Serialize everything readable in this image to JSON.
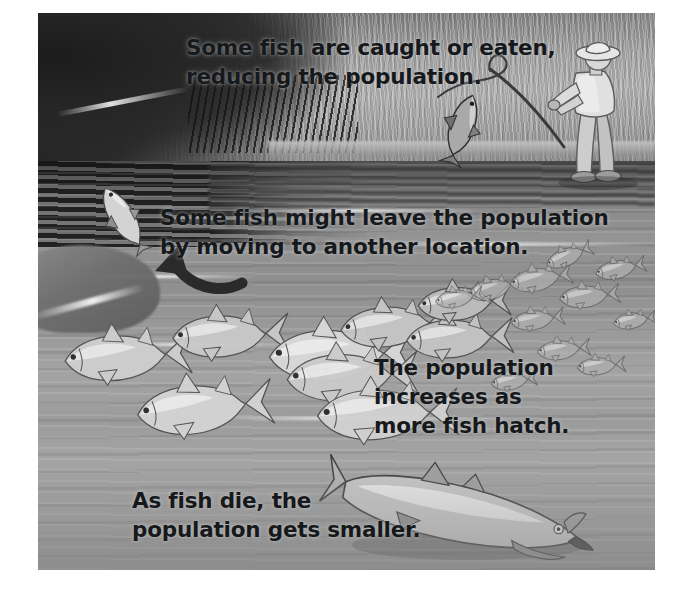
{
  "scene": {
    "title": "Fish population changes illustration",
    "description": "A riverbank scene showing four ways a fish population changes: fish caught by an angler, fish leaving, fish hatching, and fish dying.",
    "border_color": "#ffffff",
    "water_color": "#949494",
    "bank_color": "#a6a6a6",
    "text_color": "#16191c"
  },
  "captions": [
    {
      "id": "caught",
      "name": "caption-caught-or-eaten",
      "text": "Some fish are caught or eaten,\nreducing the population."
    },
    {
      "id": "leave",
      "name": "caption-fish-leave",
      "text": "Some fish might leave the population\nby moving to another location."
    },
    {
      "id": "increase",
      "name": "caption-population-increases",
      "text": "The population\nincreases as\nmore fish hatch."
    },
    {
      "id": "die",
      "name": "caption-fish-die",
      "text": "As fish die, the\npopulation gets smaller."
    }
  ],
  "figures": {
    "angler": "fisherman-figure",
    "caught_fish": "hooked-fish",
    "fishing_rod": "fishing-rod",
    "departure_arrow": "departure-arrow",
    "leaving_fish": "leaving-fish",
    "dead_fish": "dead-fish",
    "school_count": 9,
    "hatchling_count": 11
  },
  "schooling_fish": [
    {
      "x": 24,
      "y": 300,
      "len": 104,
      "tilt": -4,
      "shade": "#cfcfcf"
    },
    {
      "x": 132,
      "y": 282,
      "len": 96,
      "tilt": -3,
      "shade": "#c9c9c9"
    },
    {
      "x": 96,
      "y": 348,
      "len": 112,
      "tilt": -6,
      "shade": "#d4d4d4"
    },
    {
      "x": 228,
      "y": 292,
      "len": 118,
      "tilt": -2,
      "shade": "#d9d9d9"
    },
    {
      "x": 246,
      "y": 318,
      "len": 108,
      "tilt": -3,
      "shade": "#cbcbcb"
    },
    {
      "x": 300,
      "y": 274,
      "len": 92,
      "tilt": -5,
      "shade": "#c6c6c6"
    },
    {
      "x": 276,
      "y": 352,
      "len": 116,
      "tilt": -2,
      "shade": "#d2d2d2"
    },
    {
      "x": 366,
      "y": 288,
      "len": 88,
      "tilt": -3,
      "shade": "#c4c4c4"
    },
    {
      "x": 378,
      "y": 258,
      "len": 76,
      "tilt": -4,
      "shade": "#bdbdbd"
    }
  ],
  "hatchling_fish": [
    {
      "x": 428,
      "y": 256,
      "len": 46,
      "tilt": -14
    },
    {
      "x": 470,
      "y": 244,
      "len": 52,
      "tilt": -10
    },
    {
      "x": 506,
      "y": 226,
      "len": 40,
      "tilt": -22
    },
    {
      "x": 520,
      "y": 262,
      "len": 50,
      "tilt": -6
    },
    {
      "x": 556,
      "y": 238,
      "len": 42,
      "tilt": -12
    },
    {
      "x": 472,
      "y": 288,
      "len": 44,
      "tilt": -8
    },
    {
      "x": 396,
      "y": 268,
      "len": 40,
      "tilt": -10
    },
    {
      "x": 498,
      "y": 318,
      "len": 44,
      "tilt": -6
    },
    {
      "x": 538,
      "y": 336,
      "len": 40,
      "tilt": -5
    },
    {
      "x": 452,
      "y": 352,
      "len": 38,
      "tilt": -8
    },
    {
      "x": 574,
      "y": 292,
      "len": 36,
      "tilt": -9
    }
  ]
}
